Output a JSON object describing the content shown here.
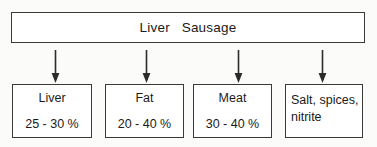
{
  "diagram": {
    "title": "Liver   Sausage",
    "header": {
      "label": "Liver   Sausage"
    },
    "arrows": [
      {
        "name": "arrow-to-liver",
        "glyph": "down-arrow-icon"
      },
      {
        "name": "arrow-to-fat",
        "glyph": "down-arrow-icon"
      },
      {
        "name": "arrow-to-meat",
        "glyph": "down-arrow-icon"
      },
      {
        "name": "arrow-to-salt",
        "glyph": "down-arrow-icon"
      }
    ],
    "components": [
      {
        "name": "Liver",
        "value": "25 - 30 %"
      },
      {
        "name": "Fat",
        "value": "20 - 40 %"
      },
      {
        "name": "Meat",
        "value": "30 - 40 %"
      },
      {
        "name": "Salt, spices,\nnitrite",
        "value": ""
      }
    ],
    "colors": {
      "background": "#fbfbfa",
      "box_fill": "#ffffff",
      "border": "#3a3a3a",
      "text": "#1a1a1a",
      "arrow": "#2b2b2b"
    }
  }
}
